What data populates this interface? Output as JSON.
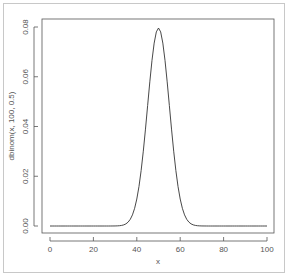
{
  "chart_data": {
    "type": "line",
    "title": "",
    "xlabel": "x",
    "ylabel": "dbinom(x, 100, 0.5)",
    "xlim": [
      0,
      100
    ],
    "ylim": [
      0,
      0.08
    ],
    "x_ticks": [
      "0",
      "20",
      "40",
      "60",
      "80",
      "100"
    ],
    "y_ticks": [
      "0.00",
      "0.02",
      "0.04",
      "0.06",
      "0.08"
    ],
    "grid": false,
    "legend": null,
    "series": [
      {
        "name": "dbinom(x, 100, 0.5)",
        "x": [
          0,
          30,
          34,
          36,
          38,
          40,
          42,
          44,
          46,
          48,
          50,
          52,
          54,
          56,
          58,
          60,
          62,
          64,
          66,
          70,
          100
        ],
        "values": [
          0.0,
          2e-05,
          0.0005,
          0.0016,
          0.0045,
          0.0108,
          0.0223,
          0.039,
          0.058,
          0.0735,
          0.0796,
          0.0735,
          0.058,
          0.039,
          0.0223,
          0.0108,
          0.0045,
          0.0016,
          0.0005,
          2e-05,
          0.0
        ]
      }
    ],
    "colors": {
      "line": "#333333",
      "axis": "#555555",
      "frame": "#c8c8c8"
    }
  }
}
